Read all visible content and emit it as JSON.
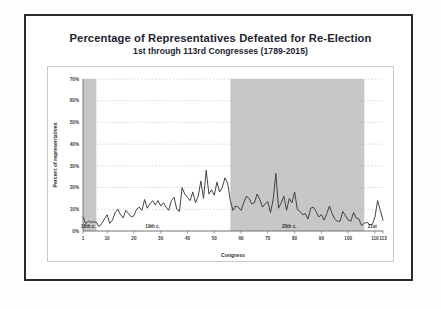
{
  "slide": {
    "title": "Percentage of Representatives Defeated for Re-Election",
    "subtitle": "1st through 113rd Congresses (1789-2015)"
  },
  "colors": {
    "line": "#3b3b3b",
    "band": "#bdbdbd",
    "grid": "#b9b9b9",
    "axis": "#555555",
    "frame_outer": "#2b2b2b",
    "frame_inner": "#c9c9c9",
    "text": "#1c2430"
  },
  "chart_data": {
    "type": "line",
    "title": "Percentage of Representatives Defeated for Re-Election",
    "subtitle": "1st through 113rd Congresses (1789-2015)",
    "xlabel": "Congress",
    "ylabel": "Percent of representatives",
    "xlim": [
      1,
      113
    ],
    "ylim": [
      0,
      70
    ],
    "grid": true,
    "legend": "none",
    "xticks": [
      1,
      10,
      20,
      30,
      40,
      50,
      60,
      70,
      80,
      90,
      100,
      110,
      113
    ],
    "xticklabels": [
      "1",
      "10",
      "20",
      "30",
      "40",
      "50",
      "60",
      "70",
      "80",
      "90",
      "100",
      "110",
      "113"
    ],
    "yticks": [
      0,
      10,
      20,
      30,
      40,
      50,
      60,
      70
    ],
    "yticklabels": [
      "0%",
      "10%",
      "20%",
      "30%",
      "40%",
      "50%",
      "60%",
      "70%"
    ],
    "shaded_bands": [
      {
        "label": "18th c.",
        "x_start": 1,
        "x_end": 6,
        "color": "#bdbdbd"
      },
      {
        "label": "20th c.",
        "x_start": 56,
        "x_end": 106,
        "color": "#bdbdbd"
      }
    ],
    "annotations": [
      {
        "text": "18th c.",
        "x": 3,
        "y": 1.5
      },
      {
        "text": "19th c.",
        "x": 27,
        "y": 1.5
      },
      {
        "text": "20th c.",
        "x": 78,
        "y": 1.5
      },
      {
        "text": "21st",
        "x": 109,
        "y": 1.5
      }
    ],
    "series": [
      {
        "name": "Percent of representatives defeated",
        "x": [
          1,
          2,
          3,
          4,
          5,
          6,
          7,
          8,
          9,
          10,
          11,
          12,
          13,
          14,
          15,
          16,
          17,
          18,
          19,
          20,
          21,
          22,
          23,
          24,
          25,
          26,
          27,
          28,
          29,
          30,
          31,
          32,
          33,
          34,
          35,
          36,
          37,
          38,
          39,
          40,
          41,
          42,
          43,
          44,
          45,
          46,
          47,
          48,
          49,
          50,
          51,
          52,
          53,
          54,
          55,
          56,
          57,
          58,
          59,
          60,
          61,
          62,
          63,
          64,
          65,
          66,
          67,
          68,
          69,
          70,
          71,
          72,
          73,
          74,
          75,
          76,
          77,
          78,
          79,
          80,
          81,
          82,
          83,
          84,
          85,
          86,
          87,
          88,
          89,
          90,
          91,
          92,
          93,
          94,
          95,
          96,
          97,
          98,
          99,
          100,
          101,
          102,
          103,
          104,
          105,
          106,
          107,
          108,
          109,
          110,
          111,
          112,
          113
        ],
        "values": [
          6.5,
          3.5,
          4.5,
          4.0,
          4.2,
          4.0,
          2.0,
          3.5,
          5.5,
          7.5,
          3.5,
          5.0,
          8.5,
          10.0,
          7.5,
          6.0,
          9.5,
          8.0,
          6.5,
          7.0,
          10.0,
          11.0,
          9.5,
          14.5,
          10.5,
          12.5,
          14.0,
          12.0,
          14.0,
          11.5,
          13.0,
          11.0,
          9.5,
          14.0,
          15.5,
          10.0,
          9.0,
          20.0,
          17.0,
          15.5,
          14.0,
          18.0,
          13.0,
          16.0,
          23.0,
          15.0,
          28.0,
          17.0,
          19.0,
          16.5,
          22.5,
          18.0,
          20.0,
          24.5,
          22.0,
          14.0,
          9.5,
          11.5,
          11.0,
          9.5,
          13.0,
          16.0,
          15.0,
          12.5,
          13.0,
          17.0,
          14.5,
          11.0,
          12.5,
          13.5,
          8.5,
          14.5,
          26.5,
          10.5,
          13.0,
          16.0,
          9.5,
          15.0,
          13.0,
          18.0,
          10.0,
          9.0,
          7.5,
          8.0,
          5.5,
          10.5,
          11.0,
          9.0,
          6.5,
          7.5,
          5.0,
          8.0,
          11.5,
          8.0,
          5.5,
          4.5,
          4.5,
          9.0,
          7.0,
          5.0,
          4.5,
          8.5,
          6.0,
          5.5,
          2.5,
          3.5,
          4.0,
          3.0,
          3.0,
          6.5,
          14.0,
          9.5,
          5.0
        ]
      }
    ]
  }
}
